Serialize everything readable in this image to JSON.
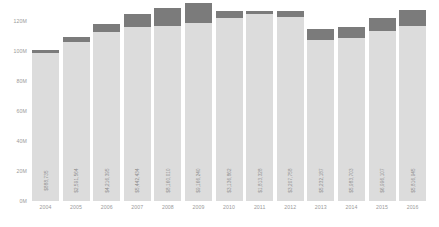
{
  "chart_data": {
    "type": "bar",
    "title": "",
    "subtitle": "",
    "xlabel": "",
    "ylabel": "",
    "grid": false,
    "legend_position": "none",
    "stacked": true,
    "ylim": [
      0,
      130000000
    ],
    "ytick_labels": [
      "120M",
      "100M",
      "80M",
      "60M",
      "40M",
      "20M",
      "0M"
    ],
    "ytick_values": [
      120000000,
      100000000,
      80000000,
      60000000,
      40000000,
      20000000,
      0
    ],
    "categories": [
      "2004",
      "2005",
      "2006",
      "2007",
      "2008",
      "2009",
      "2010",
      "2011",
      "2012",
      "2013",
      "2014",
      "2015",
      "2016"
    ],
    "series": [
      {
        "name": "base",
        "color": "#dcdcdc",
        "values": [
          99000000,
          106000000,
          112500000,
          116000000,
          117000000,
          119000000,
          122000000,
          124500000,
          122500000,
          107500000,
          108500000,
          113500000,
          117000000
        ]
      },
      {
        "name": "top",
        "color": "#7b7b7b",
        "values": [
          1500000,
          3500000,
          5500000,
          8500000,
          11500000,
          13000000,
          5000000,
          2500000,
          4000000,
          7500000,
          7500000,
          8500000,
          10500000
        ]
      }
    ],
    "bar_labels": [
      "$888,735",
      "$2,591,564",
      "$4,216,395",
      "$5,442,434",
      "$8,160,010",
      "$9,166,240",
      "$3,136,862",
      "$1,813,328",
      "$3,207,758",
      "$5,232,187",
      "$5,983,703",
      "$6,996,107",
      "$5,816,945"
    ]
  }
}
